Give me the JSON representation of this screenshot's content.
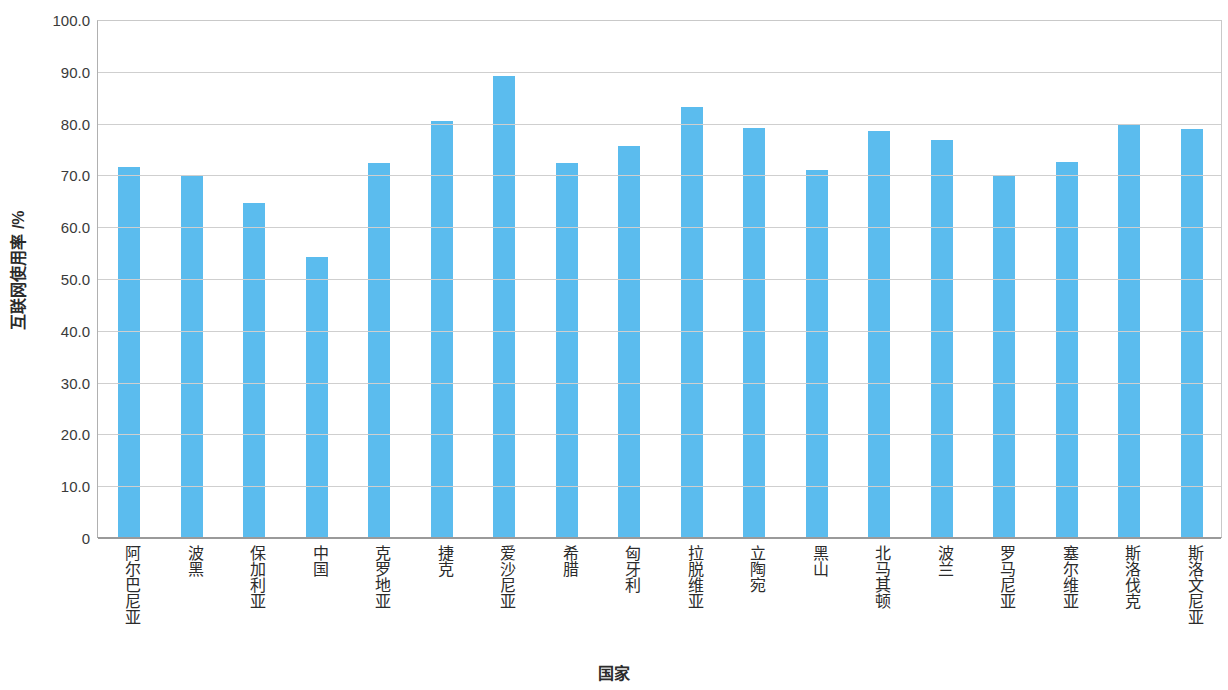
{
  "chart_data": {
    "type": "bar",
    "title": "",
    "subtitle": "",
    "xlabel": "国家",
    "ylabel": "互联网使用率 /%",
    "ylim": [
      0,
      100
    ],
    "grid": true,
    "legend": null,
    "legend_position": "none",
    "bar_color": "#5bbcee",
    "axis_color": "#9a9a9a",
    "gridline_color": "#cfcfcf",
    "y_ticks": [
      "0",
      "10.0",
      "20.0",
      "30.0",
      "40.0",
      "50.0",
      "60.0",
      "70.0",
      "80.0",
      "90.0",
      "100.0"
    ],
    "y_tick_values": [
      0,
      10,
      20,
      30,
      40,
      50,
      60,
      70,
      80,
      90,
      100
    ],
    "categories": [
      "阿尔巴尼亚",
      "波黑",
      "保加利亚",
      "中国",
      "克罗地亚",
      "捷克",
      "爱沙尼亚",
      "希腊",
      "匈牙利",
      "拉脱维亚",
      "立陶宛",
      "黑山",
      "北马其顿",
      "波兰",
      "罗马尼亚",
      "塞尔维亚",
      "斯洛伐克",
      "斯洛文尼亚"
    ],
    "values": [
      71.5,
      69.8,
      64.4,
      54.0,
      72.2,
      80.3,
      89.0,
      72.3,
      75.5,
      83.0,
      79.0,
      70.8,
      78.4,
      76.7,
      69.8,
      72.4,
      79.8,
      78.7
    ]
  }
}
